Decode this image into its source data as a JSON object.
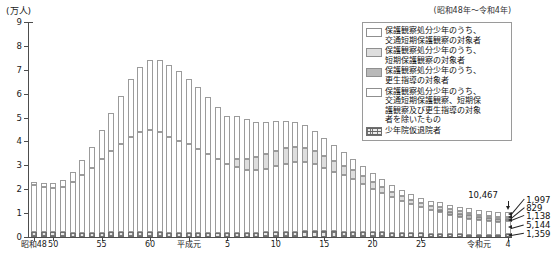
{
  "chart_data": {
    "type": "bar",
    "stacked": true,
    "title": "",
    "subtitle": "(昭和48年～令和4年)",
    "ylabel": "(万人)",
    "xlabel": "",
    "ylim": [
      0,
      9
    ],
    "yticks": [
      0,
      1,
      2,
      3,
      4,
      5,
      6,
      7,
      8,
      9
    ],
    "ytick_labels": [
      "0",
      "1",
      "2",
      "3",
      "4",
      "5",
      "6",
      "7",
      "8",
      "9"
    ],
    "unit_note": "万人 (10,000 persons)",
    "grid": false,
    "legend_position": "top-right",
    "series": [
      {
        "name": "少年院仮退院者",
        "key": "juvenile_training_school_parole",
        "pattern": "hatch",
        "values": [
          2100,
          2050,
          1950,
          1900,
          1850,
          1800,
          1800,
          1850,
          1900,
          1950,
          2000,
          2000,
          1950,
          1900,
          1850,
          1800,
          1750,
          1700,
          1650,
          1600,
          1600,
          1650,
          1750,
          1850,
          1950,
          2050,
          2150,
          2250,
          2350,
          2400,
          2400,
          2350,
          2300,
          2250,
          2150,
          2050,
          1950,
          1850,
          1750,
          1650,
          1550,
          1450,
          1350,
          1250,
          1150,
          1050,
          950,
          820,
          700,
          1359
        ]
      },
      {
        "name": "保護観察処分少年のうち、交通短期保護観察、短期保護観察及び更生指導の対象者を除いたもの",
        "key": "probation_other",
        "pattern": "plain",
        "values": [
          19500,
          19000,
          18500,
          19000,
          21000,
          24000,
          27000,
          31000,
          34000,
          37000,
          40000,
          42000,
          43000,
          42000,
          40000,
          38500,
          37000,
          35000,
          33000,
          31000,
          29000,
          27500,
          26500,
          26000,
          26500,
          27500,
          28500,
          29000,
          29000,
          28000,
          26500,
          25000,
          23500,
          22000,
          20000,
          18000,
          16500,
          15000,
          13500,
          12000,
          11000,
          10000,
          9000,
          8000,
          7200,
          6600,
          6100,
          5700,
          5400,
          5144
        ]
      },
      {
        "name": "保護観察処分少年のうち、更生指導の対象者",
        "key": "rehabilitation_guidance",
        "pattern": "mid",
        "values": [
          0,
          0,
          0,
          0,
          0,
          0,
          0,
          0,
          0,
          0,
          0,
          0,
          0,
          0,
          0,
          0,
          0,
          0,
          0,
          0,
          0,
          0,
          0,
          0,
          0,
          0,
          0,
          0,
          0,
          0,
          0,
          0,
          0,
          0,
          0,
          0,
          0,
          0,
          0,
          0,
          0,
          0,
          900,
          1200,
          1400,
          1500,
          1450,
          1350,
          1250,
          1138
        ]
      },
      {
        "name": "保護観察処分少年のうち、短期保護観察の対象者",
        "key": "short_term_probation",
        "pattern": "light",
        "values": [
          0,
          0,
          0,
          0,
          0,
          0,
          0,
          0,
          0,
          0,
          0,
          0,
          0,
          0,
          0,
          0,
          0,
          0,
          0,
          0,
          0,
          3500,
          4500,
          5500,
          6200,
          6500,
          6600,
          6400,
          6000,
          5500,
          5000,
          4500,
          4000,
          3600,
          3200,
          2800,
          2500,
          2200,
          2000,
          1800,
          1600,
          1450,
          1300,
          1150,
          1050,
          980,
          920,
          880,
          850,
          829
        ]
      },
      {
        "name": "保護観察処分少年のうち、交通短期保護観察の対象者",
        "key": "traffic_short_term_probation",
        "pattern": "top",
        "values": [
          1500,
          1600,
          2000,
          3000,
          4500,
          6500,
          9000,
          12000,
          16000,
          20000,
          24000,
          27000,
          29000,
          30000,
          30000,
          29000,
          27500,
          26000,
          24000,
          22000,
          20000,
          18000,
          16500,
          15000,
          13500,
          12500,
          11500,
          10500,
          9500,
          8500,
          7500,
          6600,
          5800,
          5000,
          4400,
          3800,
          3300,
          2900,
          2600,
          2400,
          2200,
          2050,
          1950,
          1900,
          1900,
          1950,
          1980,
          2000,
          2000,
          1997
        ]
      }
    ],
    "x_tick_labels": [
      {
        "index": 0,
        "label": "昭和48"
      },
      {
        "index": 2,
        "label": "50"
      },
      {
        "index": 7,
        "label": "55"
      },
      {
        "index": 12,
        "label": "60"
      },
      {
        "index": 16,
        "label": "平成元"
      },
      {
        "index": 20,
        "label": "5"
      },
      {
        "index": 25,
        "label": "10"
      },
      {
        "index": 30,
        "label": "15"
      },
      {
        "index": 35,
        "label": "20"
      },
      {
        "index": 40,
        "label": "25"
      },
      {
        "index": 46,
        "label": "令和元"
      },
      {
        "index": 49,
        "label": "4"
      }
    ],
    "annotations": {
      "total": "10,467",
      "segment_values": [
        "1,997",
        "829",
        "1,138",
        "5,144",
        "1,359"
      ]
    }
  },
  "legend": {
    "items": [
      {
        "swatch": "white",
        "lines": [
          "保護観察処分少年のうち、",
          "交通短期保護観察の対象者"
        ]
      },
      {
        "swatch": "light",
        "lines": [
          "保護観察処分少年のうち、",
          "短期保護観察の対象者"
        ]
      },
      {
        "swatch": "mid",
        "lines": [
          "保護観察処分少年のうち、",
          "更生指導の対象者"
        ]
      },
      {
        "swatch": "white",
        "lines": [
          "保護観察処分少年のうち、",
          "交通短期保護観察、短期保",
          "護観察及び更生指導の対象",
          "者を除いたもの"
        ]
      },
      {
        "swatch": "hatch",
        "lines": [
          "少年院仮退院者"
        ]
      }
    ]
  },
  "axis": {
    "unit_label": "(万人)",
    "period_label": "(昭和48年～令和4年)"
  }
}
